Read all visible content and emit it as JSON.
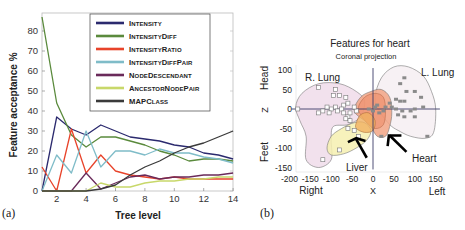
{
  "panels": {
    "a_label": "(a)",
    "b_label": "(b)"
  },
  "chart_data": [
    {
      "type": "line",
      "panel": "(a)",
      "title": "",
      "xlabel": "Tree level",
      "ylabel": "Feature acceptance %",
      "xlim": [
        1,
        14
      ],
      "ylim": [
        0,
        87
      ],
      "xticks": [
        2,
        4,
        6,
        8,
        10,
        12,
        14
      ],
      "yticks": [
        0,
        10,
        20,
        30,
        40,
        50,
        60,
        70,
        80
      ],
      "grid": false,
      "legend_position": "upper center",
      "x": [
        1,
        2,
        3,
        4,
        5,
        6,
        7,
        8,
        9,
        10,
        11,
        12,
        13,
        14
      ],
      "series": [
        {
          "name": "Intensity",
          "color": "#2b2a6e",
          "values": [
            0,
            37,
            31,
            28,
            33,
            30,
            27,
            26,
            25,
            23,
            22,
            19,
            18,
            16
          ]
        },
        {
          "name": "IntensityDiff",
          "color": "#5a8a3c",
          "values": [
            87,
            44,
            28,
            22,
            27,
            27,
            25,
            23,
            20,
            18,
            15,
            16,
            16,
            15
          ]
        },
        {
          "name": "IntensityRatio",
          "color": "#e8432a",
          "values": [
            12,
            0,
            31,
            9,
            18,
            10,
            8,
            7,
            6,
            7,
            6,
            6,
            6,
            6
          ]
        },
        {
          "name": "IntensityDiffPair",
          "color": "#7fbcc8",
          "values": [
            0,
            18,
            9,
            30,
            12,
            20,
            20,
            18,
            21,
            19,
            19,
            17,
            16,
            14
          ]
        },
        {
          "name": "NodeDescendant",
          "color": "#6a2a5a",
          "values": [
            0,
            0,
            0,
            9,
            1,
            4,
            7,
            8,
            6,
            7,
            7,
            8,
            8,
            9
          ]
        },
        {
          "name": "AncestorNodePair",
          "color": "#c8d86a",
          "values": [
            0,
            0,
            0,
            0,
            4,
            2,
            2,
            4,
            5,
            5,
            6,
            6,
            7,
            7
          ]
        },
        {
          "name": "MAPClass",
          "color": "#3a3a3a",
          "values": [
            0,
            0,
            0,
            0,
            1,
            3,
            8,
            12,
            15,
            19,
            22,
            24,
            27,
            30
          ]
        }
      ]
    },
    {
      "type": "scatter",
      "panel": "(b)",
      "title": "Features for heart",
      "subtitle": "Coronal projection",
      "xlabel": "X",
      "ylabel": "Z",
      "x_side_labels": {
        "left": "Right",
        "right": "Left"
      },
      "y_side_labels": {
        "top": "Head",
        "bottom": "Feet"
      },
      "xlim": [
        -200,
        150
      ],
      "ylim": [
        -150,
        110
      ],
      "xticks": [
        -200,
        -150,
        -100,
        -50,
        0,
        50,
        100,
        150
      ],
      "yticks": [
        100,
        50,
        0,
        -50,
        -100,
        -150
      ],
      "regions": [
        {
          "name": "R. Lung",
          "fill": "#f0dcea"
        },
        {
          "name": "L. Lung",
          "fill": "#f6eef2"
        },
        {
          "name": "Heart",
          "fill": "#f2a585"
        },
        {
          "name": "Liver",
          "fill": "#f6f0b0"
        }
      ],
      "annotations": [
        "R. Lung",
        "L. Lung",
        "Heart",
        "Liver"
      ],
      "series": [
        {
          "name": "R. Lung features (open squares)",
          "points": [
            [
              -130,
              55
            ],
            [
              -95,
              35
            ],
            [
              -90,
              50
            ],
            [
              -80,
              35
            ],
            [
              -65,
              30
            ],
            [
              -70,
              10
            ],
            [
              -60,
              15
            ],
            [
              -75,
              0
            ],
            [
              -90,
              5
            ],
            [
              -100,
              0
            ],
            [
              -110,
              5
            ],
            [
              -105,
              -10
            ],
            [
              -85,
              -5
            ],
            [
              -70,
              -10
            ],
            [
              -60,
              -20
            ],
            [
              -65,
              -25
            ],
            [
              -55,
              -30
            ],
            [
              -55,
              -10
            ],
            [
              -40,
              -5
            ],
            [
              -45,
              5
            ],
            [
              -180,
              0
            ],
            [
              -120,
              -5
            ],
            [
              -130,
              -10
            ],
            [
              -60,
              -50
            ],
            [
              -45,
              -55
            ],
            [
              -35,
              -70
            ],
            [
              -120,
              -130
            ],
            [
              -80,
              -105
            ]
          ]
        },
        {
          "name": "L. Lung / heart features (filled squares)",
          "points": [
            [
              75,
              80
            ],
            [
              65,
              65
            ],
            [
              80,
              45
            ],
            [
              100,
              45
            ],
            [
              115,
              30
            ],
            [
              55,
              25
            ],
            [
              65,
              20
            ],
            [
              75,
              20
            ],
            [
              40,
              15
            ],
            [
              10,
              10
            ],
            [
              30,
              5
            ],
            [
              45,
              5
            ],
            [
              55,
              0
            ],
            [
              70,
              -5
            ],
            [
              90,
              -5
            ],
            [
              100,
              0
            ],
            [
              120,
              5
            ],
            [
              25,
              -5
            ],
            [
              15,
              -10
            ],
            [
              60,
              -15
            ],
            [
              75,
              -20
            ],
            [
              100,
              -20
            ],
            [
              130,
              -70
            ],
            [
              20,
              -70
            ],
            [
              -10,
              0
            ],
            [
              0,
              -5
            ],
            [
              5,
              5
            ]
          ]
        }
      ]
    }
  ]
}
